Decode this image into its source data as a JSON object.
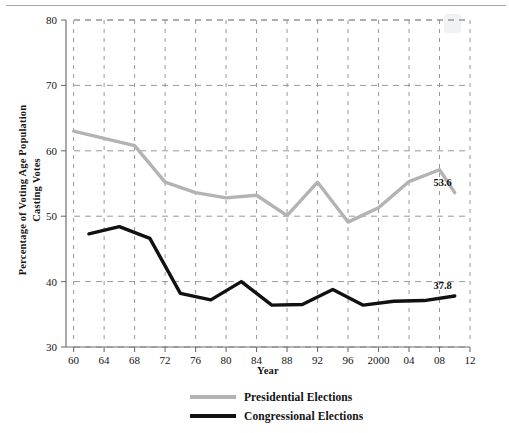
{
  "chart_data": {
    "type": "line",
    "title": "",
    "xlabel": "Year",
    "ylabel": "Percentage of Voting Age Population Casting Votes",
    "ylabel_line1": "Percentage of Voting Age Population",
    "ylabel_line2": "Casting Votes",
    "xlim": [
      1959,
      2012
    ],
    "ylim": [
      30,
      80
    ],
    "yticks": [
      30,
      40,
      50,
      60,
      70,
      80
    ],
    "ytick_labels": [
      "30",
      "40",
      "50",
      "60",
      "70",
      "80"
    ],
    "xticks": [
      1960,
      1964,
      1968,
      1972,
      1976,
      1980,
      1984,
      1988,
      1992,
      1996,
      2000,
      2004,
      2008,
      2012
    ],
    "xtick_labels": [
      "60",
      "64",
      "68",
      "72",
      "76",
      "80",
      "84",
      "88",
      "92",
      "96",
      "2000",
      "04",
      "08",
      "12"
    ],
    "grid": true,
    "grid_style": "dashed",
    "legend_position": "bottom-center",
    "series": [
      {
        "name": "Presidential Elections",
        "color": "#b3b3b3",
        "x": [
          1960,
          1964,
          1968,
          1972,
          1976,
          1980,
          1984,
          1988,
          1992,
          1996,
          2000,
          2004,
          2008,
          2010
        ],
        "values": [
          63.0,
          61.9,
          60.8,
          55.2,
          53.6,
          52.8,
          53.2,
          50.1,
          55.2,
          49.1,
          51.3,
          55.3,
          57.1,
          53.6
        ]
      },
      {
        "name": "Congressional Elections",
        "color": "#111111",
        "x": [
          1962,
          1966,
          1970,
          1974,
          1978,
          1982,
          1986,
          1990,
          1994,
          1998,
          2002,
          2006,
          2010
        ],
        "values": [
          47.3,
          48.4,
          46.6,
          38.2,
          37.2,
          40.0,
          36.4,
          36.5,
          38.8,
          36.4,
          37.0,
          37.1,
          37.8
        ]
      }
    ],
    "annotations": [
      {
        "text": "53.6",
        "x": 2010,
        "y": 53.6,
        "series": "Presidential Elections"
      },
      {
        "text": "37.8",
        "x": 2010,
        "y": 37.8,
        "series": "Congressional Elections"
      }
    ]
  },
  "legend": {
    "items": [
      {
        "label": "Presidential Elections",
        "color": "#b3b3b3"
      },
      {
        "label": "Congressional Elections",
        "color": "#111111"
      }
    ]
  },
  "watermark": {
    "text": ""
  }
}
